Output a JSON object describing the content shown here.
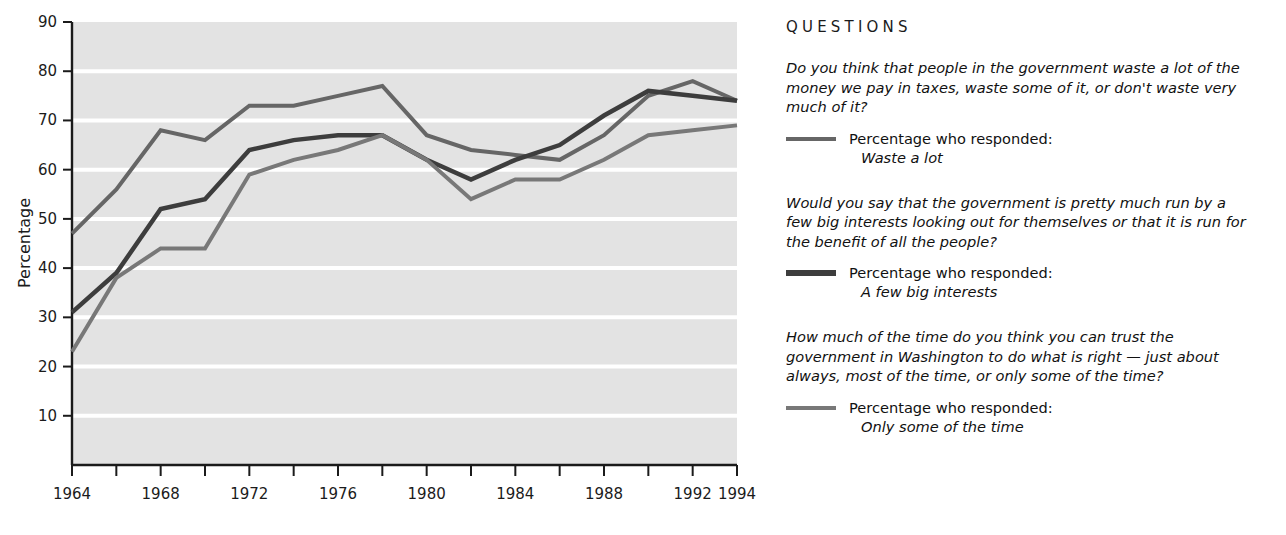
{
  "chart_data": {
    "type": "line",
    "title": "",
    "xlabel": "",
    "ylabel": "Percentage",
    "ylim": [
      0,
      90
    ],
    "xlim": [
      1964,
      1994
    ],
    "grid": true,
    "legend_position": "right",
    "y_ticks": [
      10,
      20,
      30,
      40,
      50,
      60,
      70,
      80,
      90
    ],
    "x_ticks": [
      1964,
      1966,
      1968,
      1970,
      1972,
      1974,
      1976,
      1978,
      1980,
      1982,
      1984,
      1986,
      1988,
      1990,
      1992,
      1994
    ],
    "x_tick_labels": [
      "1964",
      "",
      "1968",
      "",
      "1972",
      "",
      "1976",
      "",
      "1980",
      "",
      "1984",
      "",
      "1988",
      "",
      "1992",
      "1994"
    ],
    "x": [
      1964,
      1966,
      1968,
      1970,
      1972,
      1974,
      1976,
      1978,
      1980,
      1982,
      1984,
      1986,
      1988,
      1990,
      1992,
      1994
    ],
    "series": [
      {
        "name": "Waste a lot",
        "color": "#666666",
        "width": 4,
        "values": [
          47,
          56,
          68,
          66,
          73,
          73,
          75,
          77,
          67,
          64,
          63,
          62,
          67,
          75,
          78,
          74
        ]
      },
      {
        "name": "A few big interests",
        "color": "#3d3d3d",
        "width": 4.5,
        "values": [
          31,
          39,
          52,
          54,
          64,
          66,
          67,
          67,
          62,
          58,
          62,
          65,
          71,
          76,
          75,
          74
        ]
      },
      {
        "name": "Only some of the time",
        "color": "#787878",
        "width": 4,
        "values": [
          23,
          38,
          44,
          44,
          59,
          62,
          64,
          67,
          62,
          54,
          58,
          58,
          62,
          67,
          68,
          69
        ]
      }
    ]
  },
  "axes": {
    "ylabel": "Percentage",
    "y_tick_labels": [
      "90",
      "80",
      "70",
      "60",
      "50",
      "40",
      "30",
      "20",
      "10"
    ],
    "x_tick_labels_visible": [
      "1964",
      "1968",
      "1972",
      "1976",
      "1980",
      "1984",
      "1988",
      "1992",
      "1994"
    ]
  },
  "panel": {
    "heading": "QUESTIONS",
    "questions": [
      {
        "text": "Do you think that people in the government waste a lot of the money we pay in taxes, waste some of it, or don't waste very much of it?",
        "legend_prefix": "Percentage who responded:",
        "legend_answer": "Waste a lot",
        "swatch_color": "#666666",
        "swatch_weight": "w-thin"
      },
      {
        "text": "Would you say that the government is pretty much run by a few big interests looking out for themselves or that it is run for the benefit of all the people?",
        "legend_prefix": "Percentage who responded:",
        "legend_answer": "A few big interests",
        "swatch_color": "#3d3d3d",
        "swatch_weight": "w-thick"
      },
      {
        "text": "How much of the time do you think you can trust the government in Washington to do what is right — just about always, most of the time, or only some of the time?",
        "legend_prefix": "Percentage who responded:",
        "legend_answer": "Only some of the time",
        "swatch_color": "#787878",
        "swatch_weight": "w-thin"
      }
    ]
  },
  "colors": {
    "plot_background": "#e3e3e3",
    "gridline": "#ffffff",
    "axis": "#1b1b1b",
    "page_background": "#ffffff"
  }
}
